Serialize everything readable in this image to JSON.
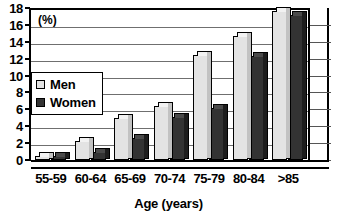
{
  "chart_data": {
    "type": "bar",
    "title": "",
    "xlabel": "Age (years)",
    "ylabel": "(%)",
    "ylim": [
      0,
      18
    ],
    "yticks": [
      0,
      2,
      4,
      6,
      8,
      10,
      12,
      14,
      16,
      18
    ],
    "grid": true,
    "legend_position": "inside-left",
    "categories": [
      "55-59",
      "60-64",
      "65-69",
      "70-74",
      "75-79",
      "80-84",
      ">85"
    ],
    "series": [
      {
        "name": "Men",
        "color": "#e3e3e3",
        "values": [
          0.5,
          2.2,
          5.0,
          6.4,
          12.4,
          14.7,
          17.6
        ]
      },
      {
        "name": "Women",
        "color": "#333333",
        "values": [
          0.5,
          1.0,
          2.6,
          5.1,
          6.2,
          12.3,
          17.2
        ]
      }
    ]
  },
  "axes": {
    "unit_label": "(%)",
    "x_title": "Age (years)"
  }
}
